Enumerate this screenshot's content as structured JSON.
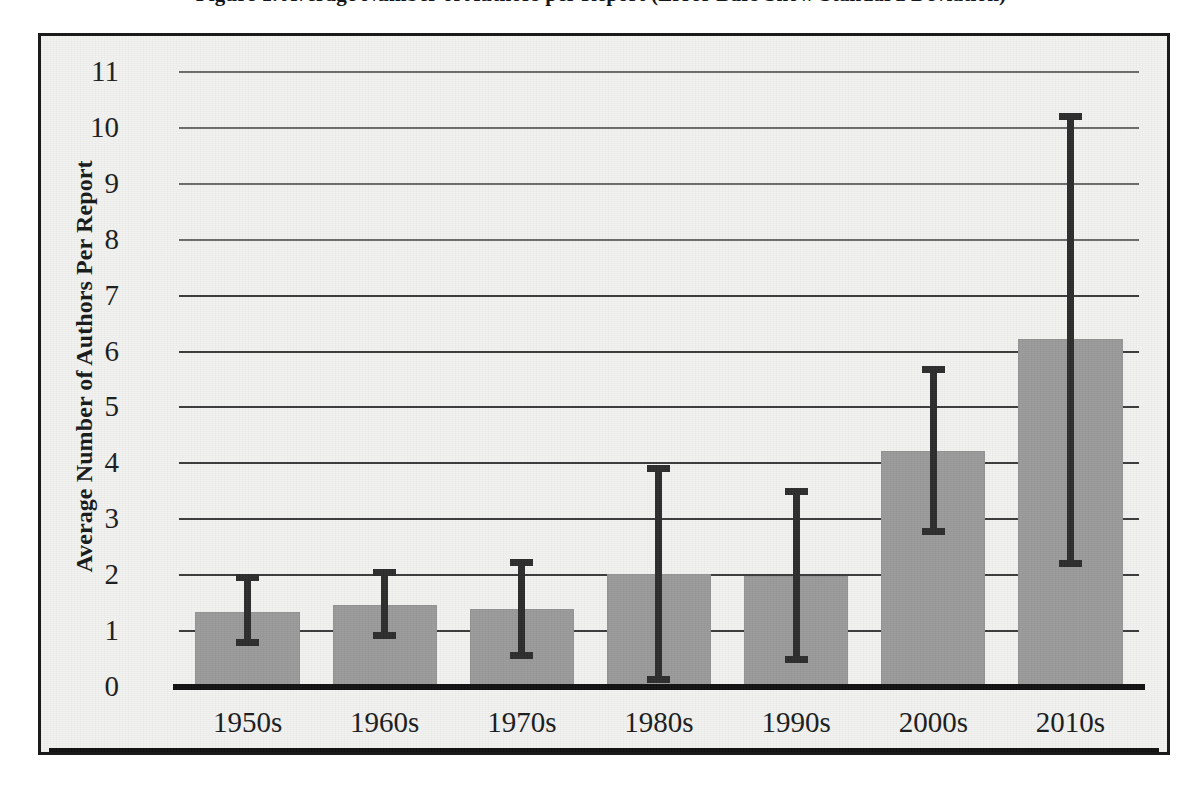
{
  "figure": {
    "title": "Figure 1. Average Number of Authors per Report (Error Bars Show Standard Deviation)"
  },
  "chart_data": {
    "type": "bar",
    "title": "Figure 1. Average Number of Authors per Report (Error Bars Show Standard Deviation)",
    "xlabel": "",
    "ylabel": "Average Number of Authors Per Report",
    "categories": [
      "1950s",
      "1960s",
      "1970s",
      "1980s",
      "1990s",
      "2000s",
      "2010s"
    ],
    "values": [
      1.33,
      1.45,
      1.38,
      2.0,
      1.97,
      4.2,
      6.2
    ],
    "error_high": [
      2.01,
      2.09,
      2.28,
      3.95,
      3.55,
      5.73,
      10.25
    ],
    "error_low": [
      0.72,
      0.84,
      0.48,
      0.05,
      0.42,
      2.7,
      2.13
    ],
    "ylim": [
      0,
      11
    ],
    "ytick_labels": [
      "0",
      "1",
      "2",
      "3",
      "4",
      "5",
      "6",
      "7",
      "8",
      "9",
      "10",
      "11"
    ],
    "grid": true,
    "legend": "none",
    "bar_color": "#9a9a9a",
    "error_color": "#2c2c2c",
    "axis_color": "#111111",
    "plot_background": "#f2f2f0"
  }
}
